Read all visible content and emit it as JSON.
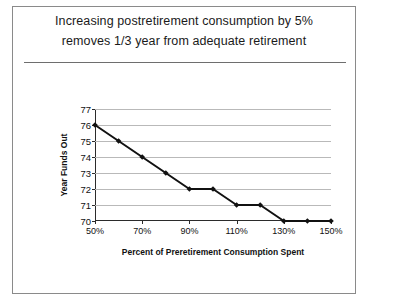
{
  "slide": {
    "title_lines": [
      "Increasing postretirement consumption by 5%",
      "removes 1/3 year from adequate retirement"
    ]
  },
  "chart_data": {
    "type": "line",
    "title": "",
    "xlabel": "Percent of Preretirement Consumption Spent",
    "ylabel": "Year Funds Out",
    "x": [
      50,
      60,
      70,
      80,
      90,
      100,
      110,
      120,
      130,
      140,
      150
    ],
    "x_tick_labels": [
      "50%",
      "70%",
      "90%",
      "110%",
      "130%",
      "150%"
    ],
    "x_tick_values": [
      50,
      70,
      90,
      110,
      130,
      150
    ],
    "xlim": [
      50,
      150
    ],
    "categories": [
      "50%",
      "60%",
      "70%",
      "80%",
      "90%",
      "100%",
      "110%",
      "120%",
      "130%",
      "140%",
      "150%"
    ],
    "values": [
      76,
      75,
      74,
      73,
      72,
      72,
      71,
      71,
      70,
      70,
      70
    ],
    "y_tick_labels": [
      "70",
      "71",
      "72",
      "73",
      "74",
      "75",
      "76",
      "77"
    ],
    "y_tick_values": [
      70,
      71,
      72,
      73,
      74,
      75,
      76,
      77
    ],
    "ylim": [
      70,
      77
    ],
    "grid": true,
    "legend": false,
    "series_color": "#111111",
    "grid_color": "#b9b9b9",
    "marker": "diamond"
  }
}
